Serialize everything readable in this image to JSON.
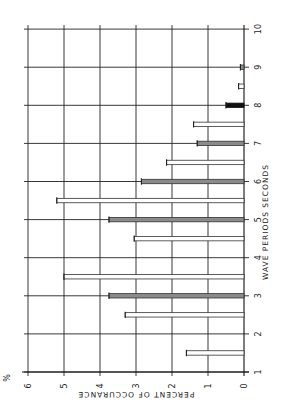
{
  "chart_data": {
    "type": "bar",
    "orientation": "rotated 90deg counter-clockwise (page printed sideways)",
    "title": "",
    "xlabel": "WAVE PERIODS SECONDS",
    "ylabel": "PERCENT OF OCCURANCE",
    "y_unit_label": "%",
    "xlim": [
      1,
      10
    ],
    "ylim": [
      0,
      6
    ],
    "x_ticks": [
      "1",
      "2",
      "3",
      "4",
      "5",
      "6",
      "7",
      "8",
      "9",
      "10"
    ],
    "y_ticks": [
      "0",
      "1",
      "2",
      "3",
      "4",
      "5",
      "6"
    ],
    "grid": true,
    "bars": [
      {
        "x": 1.5,
        "value": 1.6,
        "style": "open"
      },
      {
        "x": 2.5,
        "value": 3.3,
        "style": "open"
      },
      {
        "x": 3.0,
        "value": 3.75,
        "style": "hatched"
      },
      {
        "x": 3.5,
        "value": 5.0,
        "style": "open"
      },
      {
        "x": 4.5,
        "value": 3.05,
        "style": "open"
      },
      {
        "x": 5.0,
        "value": 3.75,
        "style": "hatched"
      },
      {
        "x": 5.5,
        "value": 5.2,
        "style": "open"
      },
      {
        "x": 6.0,
        "value": 2.85,
        "style": "hatched"
      },
      {
        "x": 6.5,
        "value": 2.15,
        "style": "open"
      },
      {
        "x": 7.0,
        "value": 1.3,
        "style": "hatched"
      },
      {
        "x": 7.5,
        "value": 1.4,
        "style": "open"
      },
      {
        "x": 8.0,
        "value": 0.5,
        "style": "solid"
      },
      {
        "x": 8.5,
        "value": 0.15,
        "style": "open"
      },
      {
        "x": 9.0,
        "value": 0.1,
        "style": "hatched"
      }
    ]
  },
  "geometry": {
    "zero_x": 244,
    "pct_px": 36,
    "period1_y": 372,
    "sec_px": 38.1,
    "bar_half_thickness": 2.2
  },
  "colors": {
    "background": "#ffffff",
    "grid": "#222222",
    "hatched_fill": "#8a8a8a",
    "solid_fill": "#111111"
  }
}
